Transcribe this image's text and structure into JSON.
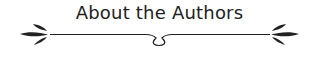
{
  "heading": {
    "title": "About the Authors"
  },
  "colors": {
    "ink": "#222222"
  },
  "ornament": {
    "name": "flourish-divider"
  }
}
